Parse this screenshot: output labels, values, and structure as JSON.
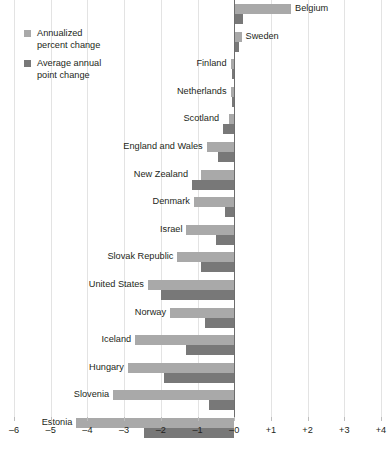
{
  "chart_data": {
    "type": "bar",
    "orientation": "horizontal",
    "title": "",
    "subtitle": "",
    "xlabel": "",
    "ylabel": "",
    "xlim": [
      -6,
      4
    ],
    "grid": true,
    "legend_position": "top-left",
    "xticks": [
      -6,
      -5,
      -4,
      -3,
      -2,
      -1,
      0,
      1,
      2,
      3,
      4
    ],
    "xticklabels": [
      "–6",
      "–5",
      "–4",
      "–3",
      "–2",
      "–1",
      "–0",
      "+1",
      "+2",
      "+3",
      "+4"
    ],
    "categories": [
      "Belgium",
      "Sweden",
      "Finland",
      "Netherlands",
      "Scotland",
      "England and Wales",
      "New Zealand",
      "Denmark",
      "Israel",
      "Slovak Republic",
      "United States",
      "Norway",
      "Iceland",
      "Hungary",
      "Slovenia",
      "Estonia"
    ],
    "series": [
      {
        "name": "Annualized percent change",
        "color": "#a9a9a9",
        "values": [
          1.55,
          0.2,
          -0.1,
          -0.1,
          -0.15,
          -0.75,
          -0.9,
          -1.1,
          -1.3,
          -1.55,
          -2.35,
          -1.75,
          -2.7,
          -2.9,
          -3.3,
          -4.3
        ]
      },
      {
        "name": "Average annual point change",
        "color": "#787878",
        "values": [
          0.25,
          0.12,
          -0.05,
          -0.05,
          -0.3,
          -0.45,
          -1.15,
          -0.25,
          -0.5,
          -0.9,
          -2.0,
          -0.8,
          -1.3,
          -1.9,
          -0.7,
          -2.45
        ]
      }
    ]
  },
  "legend": {
    "items": [
      {
        "label_line1": "Annualized",
        "label_line2": "percent change"
      },
      {
        "label_line1": "Average annual",
        "label_line2": "point change"
      }
    ]
  }
}
